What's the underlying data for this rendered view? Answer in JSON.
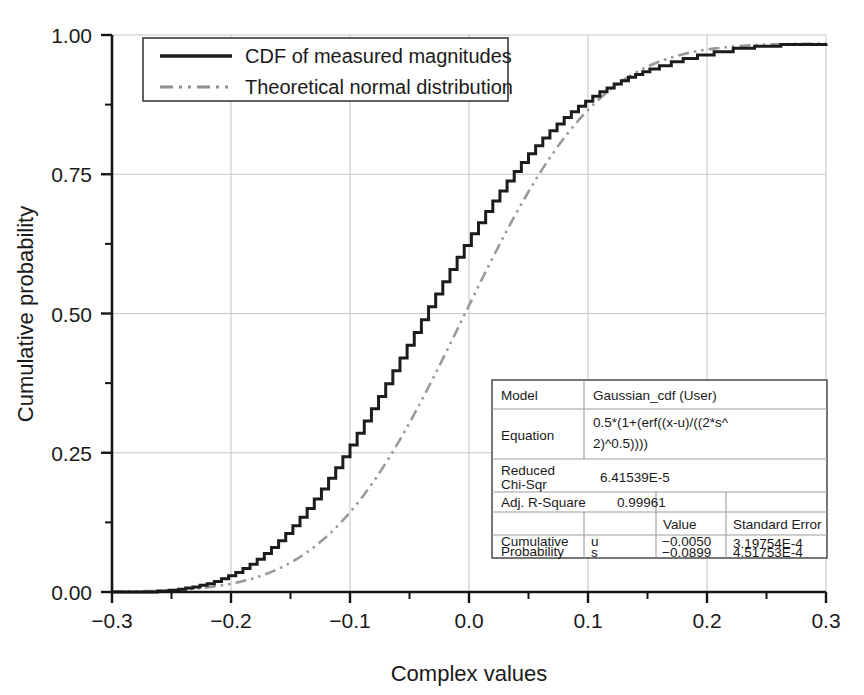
{
  "chart_data": {
    "type": "line",
    "title": "",
    "xlabel": "Complex values",
    "ylabel": "Cumulative probability",
    "xlim": [
      -0.3,
      0.3
    ],
    "ylim": [
      0.0,
      1.0
    ],
    "xticks": [
      -0.3,
      -0.2,
      -0.1,
      0.0,
      0.1,
      0.2,
      0.3
    ],
    "xtick_labels": [
      "−0.3",
      "−0.2",
      "−0.1",
      "0.0",
      "0.1",
      "0.2",
      "0.3"
    ],
    "yticks": [
      0.0,
      0.25,
      0.5,
      0.75,
      1.0
    ],
    "ytick_labels": [
      "0.00",
      "0.25",
      "0.50",
      "0.75",
      "1.00"
    ],
    "x_minor_step": 0.05,
    "y_minor_step": 0.125,
    "grid": "major gridlines, light gray, both axes",
    "legend_position": "upper left",
    "series": [
      {
        "name": "CDF of measured magnitudes",
        "style": "solid",
        "color": "#1c1c1c",
        "kind": "empirical-step",
        "x": [
          -0.3,
          -0.272,
          -0.262,
          -0.252,
          -0.244,
          -0.238,
          -0.232,
          -0.226,
          -0.22,
          -0.214,
          -0.208,
          -0.202,
          -0.196,
          -0.19,
          -0.184,
          -0.178,
          -0.172,
          -0.166,
          -0.16,
          -0.154,
          -0.148,
          -0.142,
          -0.136,
          -0.13,
          -0.124,
          -0.118,
          -0.112,
          -0.106,
          -0.1,
          -0.094,
          -0.088,
          -0.082,
          -0.076,
          -0.07,
          -0.064,
          -0.058,
          -0.052,
          -0.046,
          -0.04,
          -0.034,
          -0.028,
          -0.022,
          -0.016,
          -0.01,
          -0.004,
          0.002,
          0.008,
          0.014,
          0.02,
          0.026,
          0.032,
          0.038,
          0.044,
          0.05,
          0.056,
          0.062,
          0.068,
          0.074,
          0.08,
          0.086,
          0.092,
          0.098,
          0.104,
          0.11,
          0.116,
          0.122,
          0.128,
          0.134,
          0.14,
          0.146,
          0.152,
          0.16,
          0.17,
          0.18,
          0.192,
          0.206,
          0.222,
          0.24,
          0.262,
          0.3
        ],
        "y": [
          0.0,
          0.0,
          0.002,
          0.003,
          0.005,
          0.007,
          0.009,
          0.012,
          0.015,
          0.019,
          0.024,
          0.029,
          0.035,
          0.042,
          0.05,
          0.059,
          0.069,
          0.08,
          0.092,
          0.105,
          0.119,
          0.134,
          0.15,
          0.167,
          0.185,
          0.204,
          0.223,
          0.243,
          0.264,
          0.285,
          0.307,
          0.329,
          0.351,
          0.374,
          0.397,
          0.42,
          0.443,
          0.466,
          0.489,
          0.512,
          0.535,
          0.557,
          0.579,
          0.601,
          0.622,
          0.643,
          0.663,
          0.683,
          0.702,
          0.72,
          0.738,
          0.755,
          0.771,
          0.787,
          0.801,
          0.815,
          0.828,
          0.84,
          0.852,
          0.862,
          0.872,
          0.881,
          0.89,
          0.898,
          0.905,
          0.912,
          0.918,
          0.924,
          0.929,
          0.934,
          0.939,
          0.945,
          0.952,
          0.958,
          0.964,
          0.97,
          0.976,
          0.98,
          0.983,
          0.985
        ]
      },
      {
        "name": "Theoretical normal distribution",
        "style": "dash-dot-dot",
        "color": "#9a9a9a",
        "kind": "gaussian-cdf",
        "mu": -0.005,
        "sigma": 0.0899,
        "scale_max": 0.985
      }
    ],
    "fit_table": {
      "rows": [
        {
          "label": "Model",
          "value": "Gaussian_cdf (User)"
        },
        {
          "label": "Equation",
          "value": "0.5*(1+(erf((x-u)/((2*s^\n2)^0.5))))"
        },
        {
          "label": "Reduced\nChi-Sqr",
          "value": "6.41539E-5"
        },
        {
          "label": "Adj. R-Square",
          "value": "0.99961"
        }
      ],
      "param_header": {
        "value_col": "Value",
        "error_col": "Standard Error"
      },
      "param_group": "Cumulative\nProbability",
      "params": [
        {
          "name": "u",
          "value": "−0.0050",
          "error": "3.19754E-4"
        },
        {
          "name": "s",
          "value": "−0.0899",
          "error": "4.51753E-4"
        }
      ]
    }
  },
  "legend": {
    "items": [
      {
        "label": "CDF of measured magnitudes",
        "swatch": "solid-line-swatch"
      },
      {
        "label": "Theoretical normal distribution",
        "swatch": "dash-dot-line-swatch"
      }
    ]
  },
  "table": {
    "model_label": "Model",
    "model_value": "Gaussian_cdf (User)",
    "equation_label": "Equation",
    "equation_line1": "0.5*(1+(erf((x-u)/((2*s^",
    "equation_line2": "2)^0.5))))",
    "chisqr_label_line1": "Reduced",
    "chisqr_label_line2": "Chi-Sqr",
    "chisqr_value": "6.41539E-5",
    "rsquare_label": "Adj. R-Square",
    "rsquare_value": "0.99961",
    "value_header": "Value",
    "error_header": "Standard Error",
    "group_line1": "Cumulative",
    "group_line2": "Probability",
    "param1_name": "u",
    "param1_value": "−0.0050",
    "param1_error": "3.19754E-4",
    "param2_name": "s",
    "param2_value": "−0.0899",
    "param2_error": "4.51753E-4"
  },
  "axes": {
    "xlabel": "Complex values",
    "ylabel": "Cumulative probability",
    "xtick_labels": [
      "−0.3",
      "−0.2",
      "−0.1",
      "0.0",
      "0.1",
      "0.2",
      "0.3"
    ],
    "ytick_labels": [
      "0.00",
      "0.25",
      "0.50",
      "0.75",
      "1.00"
    ]
  },
  "colors": {
    "empirical": "#1c1c1c",
    "theoretical": "#9a9a9a",
    "grid": "#c8c8c8",
    "axis": "#151515",
    "background": "#ffffff"
  }
}
